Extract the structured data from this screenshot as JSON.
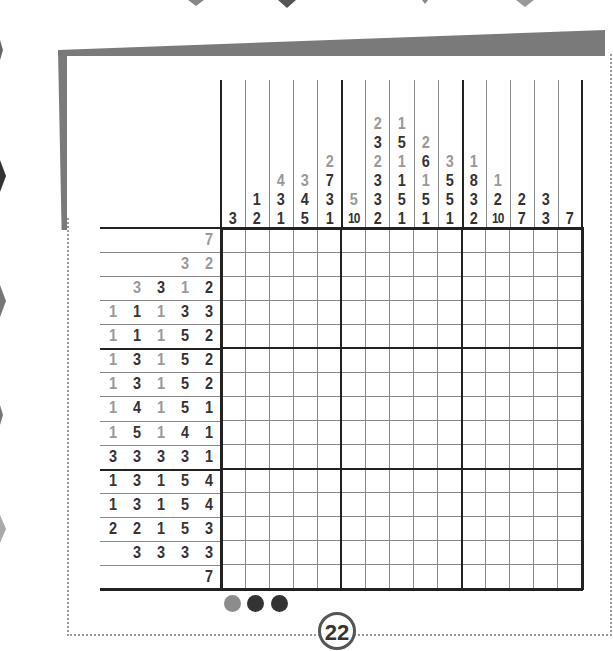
{
  "puzzle": {
    "type": "nonogram",
    "size": [
      15,
      15
    ],
    "column_clues": [
      [
        {
          "v": "3",
          "c": "d"
        }
      ],
      [
        {
          "v": "1",
          "c": "d"
        },
        {
          "v": "2",
          "c": "d"
        }
      ],
      [
        {
          "v": "4",
          "c": "g"
        },
        {
          "v": "3",
          "c": "d"
        },
        {
          "v": "1",
          "c": "d"
        }
      ],
      [
        {
          "v": "3",
          "c": "g"
        },
        {
          "v": "4",
          "c": "d"
        },
        {
          "v": "5",
          "c": "d"
        }
      ],
      [
        {
          "v": "2",
          "c": "g"
        },
        {
          "v": "7",
          "c": "d"
        },
        {
          "v": "3",
          "c": "d"
        },
        {
          "v": "1",
          "c": "d"
        }
      ],
      [
        {
          "v": "5",
          "c": "g"
        },
        {
          "v": "10",
          "c": "d"
        }
      ],
      [
        {
          "v": "2",
          "c": "g"
        },
        {
          "v": "3",
          "c": "d"
        },
        {
          "v": "2",
          "c": "g"
        },
        {
          "v": "3",
          "c": "d"
        },
        {
          "v": "3",
          "c": "d"
        },
        {
          "v": "2",
          "c": "d"
        }
      ],
      [
        {
          "v": "1",
          "c": "g"
        },
        {
          "v": "5",
          "c": "d"
        },
        {
          "v": "1",
          "c": "g"
        },
        {
          "v": "1",
          "c": "d"
        },
        {
          "v": "5",
          "c": "d"
        },
        {
          "v": "1",
          "c": "d"
        }
      ],
      [
        {
          "v": "2",
          "c": "g"
        },
        {
          "v": "6",
          "c": "d"
        },
        {
          "v": "1",
          "c": "g"
        },
        {
          "v": "5",
          "c": "d"
        },
        {
          "v": "1",
          "c": "d"
        }
      ],
      [
        {
          "v": "3",
          "c": "g"
        },
        {
          "v": "5",
          "c": "d"
        },
        {
          "v": "5",
          "c": "d"
        },
        {
          "v": "1",
          "c": "d"
        }
      ],
      [
        {
          "v": "1",
          "c": "g"
        },
        {
          "v": "8",
          "c": "d"
        },
        {
          "v": "3",
          "c": "d"
        },
        {
          "v": "2",
          "c": "d"
        }
      ],
      [
        {
          "v": "1",
          "c": "g"
        },
        {
          "v": "2",
          "c": "d"
        },
        {
          "v": "10",
          "c": "d"
        }
      ],
      [
        {
          "v": "2",
          "c": "d"
        },
        {
          "v": "7",
          "c": "d"
        }
      ],
      [
        {
          "v": "3",
          "c": "d"
        },
        {
          "v": "3",
          "c": "d"
        }
      ],
      [
        {
          "v": "7",
          "c": "d"
        }
      ]
    ],
    "row_clues": [
      [
        {
          "v": "7",
          "c": "g"
        }
      ],
      [
        {
          "v": "3",
          "c": "g"
        },
        {
          "v": "2",
          "c": "g"
        }
      ],
      [
        {
          "v": "3",
          "c": "g"
        },
        {
          "v": "3",
          "c": "d"
        },
        {
          "v": "1",
          "c": "g"
        },
        {
          "v": "2",
          "c": "d"
        }
      ],
      [
        {
          "v": "1",
          "c": "g"
        },
        {
          "v": "1",
          "c": "d"
        },
        {
          "v": "1",
          "c": "g"
        },
        {
          "v": "3",
          "c": "d"
        },
        {
          "v": "3",
          "c": "d"
        }
      ],
      [
        {
          "v": "1",
          "c": "g"
        },
        {
          "v": "1",
          "c": "d"
        },
        {
          "v": "1",
          "c": "g"
        },
        {
          "v": "5",
          "c": "d"
        },
        {
          "v": "2",
          "c": "d"
        }
      ],
      [
        {
          "v": "1",
          "c": "g"
        },
        {
          "v": "3",
          "c": "d"
        },
        {
          "v": "1",
          "c": "g"
        },
        {
          "v": "5",
          "c": "d"
        },
        {
          "v": "2",
          "c": "d"
        }
      ],
      [
        {
          "v": "1",
          "c": "g"
        },
        {
          "v": "3",
          "c": "d"
        },
        {
          "v": "1",
          "c": "g"
        },
        {
          "v": "5",
          "c": "d"
        },
        {
          "v": "2",
          "c": "d"
        }
      ],
      [
        {
          "v": "1",
          "c": "g"
        },
        {
          "v": "4",
          "c": "d"
        },
        {
          "v": "1",
          "c": "g"
        },
        {
          "v": "5",
          "c": "d"
        },
        {
          "v": "1",
          "c": "d"
        }
      ],
      [
        {
          "v": "1",
          "c": "g"
        },
        {
          "v": "5",
          "c": "d"
        },
        {
          "v": "1",
          "c": "g"
        },
        {
          "v": "4",
          "c": "d"
        },
        {
          "v": "1",
          "c": "d"
        }
      ],
      [
        {
          "v": "3",
          "c": "d"
        },
        {
          "v": "3",
          "c": "d"
        },
        {
          "v": "3",
          "c": "d"
        },
        {
          "v": "3",
          "c": "d"
        },
        {
          "v": "1",
          "c": "d"
        }
      ],
      [
        {
          "v": "1",
          "c": "d"
        },
        {
          "v": "3",
          "c": "d"
        },
        {
          "v": "1",
          "c": "d"
        },
        {
          "v": "5",
          "c": "d"
        },
        {
          "v": "4",
          "c": "d"
        }
      ],
      [
        {
          "v": "1",
          "c": "d"
        },
        {
          "v": "3",
          "c": "d"
        },
        {
          "v": "1",
          "c": "d"
        },
        {
          "v": "5",
          "c": "d"
        },
        {
          "v": "4",
          "c": "d"
        }
      ],
      [
        {
          "v": "2",
          "c": "d"
        },
        {
          "v": "2",
          "c": "d"
        },
        {
          "v": "1",
          "c": "d"
        },
        {
          "v": "5",
          "c": "d"
        },
        {
          "v": "3",
          "c": "d"
        }
      ],
      [
        {
          "v": "3",
          "c": "d"
        },
        {
          "v": "3",
          "c": "d"
        },
        {
          "v": "3",
          "c": "d"
        },
        {
          "v": "3",
          "c": "d"
        }
      ],
      [
        {
          "v": "7",
          "c": "d"
        }
      ]
    ]
  },
  "difficulty": {
    "dots": [
      "#8c8c8c",
      "#333333",
      "#333333"
    ]
  },
  "page_number": "22",
  "colors": {
    "dark_clue": "#333333",
    "gray_clue": "#999999",
    "frame": "#7a7a7a",
    "grid_thick": "#222222",
    "grid_thin": "#888888"
  }
}
